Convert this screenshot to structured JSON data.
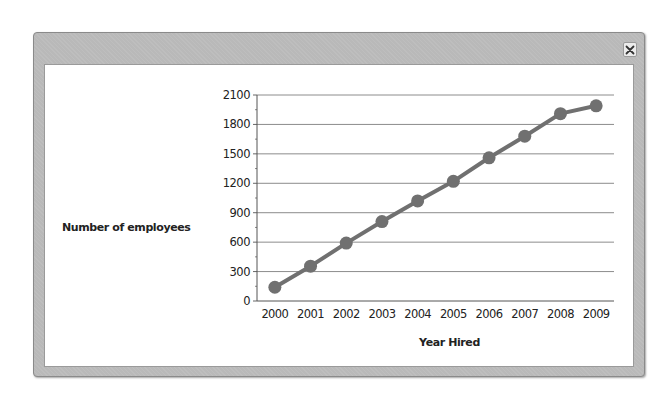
{
  "window": {
    "close_label": "×"
  },
  "chart_data": {
    "type": "line",
    "title": "",
    "xlabel": "Year Hired",
    "ylabel": "Number of employees",
    "categories": [
      "2000",
      "2001",
      "2002",
      "2003",
      "2004",
      "2005",
      "2006",
      "2007",
      "2008",
      "2009"
    ],
    "series": [
      {
        "name": "Number of employees",
        "values": [
          140,
          355,
          590,
          810,
          1020,
          1220,
          1460,
          1680,
          1910,
          1990
        ],
        "color": "#707070"
      }
    ],
    "yticks": [
      0,
      300,
      600,
      900,
      1200,
      1500,
      1800,
      2100
    ],
    "ylim": [
      0,
      2100
    ],
    "grid": true,
    "legend": "none"
  }
}
